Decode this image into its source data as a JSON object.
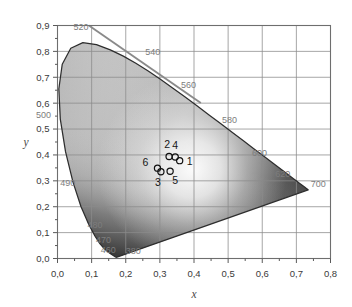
{
  "figure": {
    "kind": "cie-1931-chromaticity-diagram",
    "background_color": "#ffffff"
  },
  "axes": {
    "x_title": "x",
    "y_title": "y",
    "grid_color": "#8d8d8d",
    "frame_color": "#6e6e6e",
    "x_ticks": [
      "0,0",
      "0,1",
      "0,2",
      "0,3",
      "0,4",
      "0,5",
      "0,6",
      "0,7",
      "0,8"
    ],
    "y_ticks": [
      "0,0",
      "0,1",
      "0,2",
      "0,3",
      "0,4",
      "0,5",
      "0,6",
      "0,7",
      "0,8",
      "0,9"
    ]
  },
  "chart_data": {
    "type": "scatter",
    "title": "",
    "xlabel": "x",
    "ylabel": "y",
    "xlim": [
      0.0,
      0.8
    ],
    "ylim": [
      0.0,
      0.9
    ],
    "grid": true,
    "legend": "none",
    "xticks": [
      0.0,
      0.1,
      0.2,
      0.3,
      0.4,
      0.5,
      0.6,
      0.7,
      0.8
    ],
    "yticks": [
      0.0,
      0.1,
      0.2,
      0.3,
      0.4,
      0.5,
      0.6,
      0.7,
      0.8,
      0.9
    ],
    "points": [
      {
        "label": "1",
        "x": 0.358,
        "y": 0.378,
        "label_dx": 10,
        "label_dy": 4
      },
      {
        "label": "2",
        "x": 0.327,
        "y": 0.394,
        "label_dx": -2,
        "label_dy": -8
      },
      {
        "label": "3",
        "x": 0.303,
        "y": 0.335,
        "label_dx": -3,
        "label_dy": 14
      },
      {
        "label": "4",
        "x": 0.345,
        "y": 0.392,
        "label_dx": 0,
        "label_dy": -8
      },
      {
        "label": "5",
        "x": 0.33,
        "y": 0.337,
        "label_dx": 5,
        "label_dy": 13
      },
      {
        "label": "6",
        "x": 0.293,
        "y": 0.349,
        "label_dx": -12,
        "label_dy": -2
      }
    ],
    "marker": {
      "shape": "circle-open",
      "radius_px": 3.1,
      "edge_color": "#111111"
    },
    "spectral_locus": {
      "description": "CIE 1931 horseshoe outline, x/y pairs from 380nm to 700nm then closed by the line of purples",
      "outline": [
        [
          0.1741,
          0.005
        ],
        [
          0.174,
          0.005
        ],
        [
          0.1738,
          0.0049
        ],
        [
          0.1736,
          0.0049
        ],
        [
          0.1733,
          0.0048
        ],
        [
          0.173,
          0.0048
        ],
        [
          0.1726,
          0.0048
        ],
        [
          0.1721,
          0.0048
        ],
        [
          0.1714,
          0.0051
        ],
        [
          0.1703,
          0.0058
        ],
        [
          0.1689,
          0.0069
        ],
        [
          0.1669,
          0.0086
        ],
        [
          0.1644,
          0.0109
        ],
        [
          0.1611,
          0.0138
        ],
        [
          0.1566,
          0.0177
        ],
        [
          0.151,
          0.0227
        ],
        [
          0.144,
          0.0297
        ],
        [
          0.1355,
          0.0399
        ],
        [
          0.1241,
          0.0578
        ],
        [
          0.1096,
          0.0868
        ],
        [
          0.0913,
          0.1327
        ],
        [
          0.0687,
          0.2007
        ],
        [
          0.0454,
          0.295
        ],
        [
          0.0235,
          0.4127
        ],
        [
          0.0082,
          0.5384
        ],
        [
          0.0039,
          0.6548
        ],
        [
          0.0139,
          0.7502
        ],
        [
          0.0389,
          0.812
        ],
        [
          0.0743,
          0.8338
        ],
        [
          0.1142,
          0.8262
        ],
        [
          0.1547,
          0.8059
        ],
        [
          0.1929,
          0.7816
        ],
        [
          0.2296,
          0.7543
        ],
        [
          0.2658,
          0.7243
        ],
        [
          0.3016,
          0.6923
        ],
        [
          0.3373,
          0.6589
        ],
        [
          0.3731,
          0.6245
        ],
        [
          0.4087,
          0.5896
        ],
        [
          0.4441,
          0.5547
        ],
        [
          0.4788,
          0.5202
        ],
        [
          0.5125,
          0.4866
        ],
        [
          0.5448,
          0.4544
        ],
        [
          0.5752,
          0.4242
        ],
        [
          0.6029,
          0.3965
        ],
        [
          0.627,
          0.3725
        ],
        [
          0.6482,
          0.3514
        ],
        [
          0.6658,
          0.334
        ],
        [
          0.6801,
          0.3197
        ],
        [
          0.6915,
          0.3083
        ],
        [
          0.7006,
          0.2993
        ],
        [
          0.7079,
          0.292
        ],
        [
          0.714,
          0.2859
        ],
        [
          0.719,
          0.2809
        ],
        [
          0.723,
          0.277
        ],
        [
          0.726,
          0.274
        ],
        [
          0.7283,
          0.2717
        ],
        [
          0.73,
          0.27
        ],
        [
          0.7311,
          0.2689
        ],
        [
          0.732,
          0.268
        ],
        [
          0.7327,
          0.2673
        ],
        [
          0.7334,
          0.2666
        ],
        [
          0.734,
          0.266
        ],
        [
          0.7344,
          0.2656
        ],
        [
          0.7346,
          0.2654
        ]
      ]
    },
    "wavelength_labels": [
      {
        "text": "380",
        "x": 0.2,
        "y": 0.018
      },
      {
        "text": "460",
        "x": 0.127,
        "y": 0.02
      },
      {
        "text": "470",
        "x": 0.113,
        "y": 0.06
      },
      {
        "text": "480",
        "x": 0.088,
        "y": 0.117
      },
      {
        "text": "490",
        "x": 0.008,
        "y": 0.281
      },
      {
        "text": "500",
        "x": -0.063,
        "y": 0.543
      },
      {
        "text": "520",
        "x": 0.047,
        "y": 0.883
      },
      {
        "text": "540",
        "x": 0.257,
        "y": 0.787
      },
      {
        "text": "560",
        "x": 0.362,
        "y": 0.66
      },
      {
        "text": "580",
        "x": 0.482,
        "y": 0.525
      },
      {
        "text": "600",
        "x": 0.57,
        "y": 0.396
      },
      {
        "text": "620",
        "x": 0.638,
        "y": 0.315
      },
      {
        "text": "700",
        "x": 0.742,
        "y": 0.277
      }
    ],
    "tangent_line": {
      "description": "straight grey diagonal across the upper-left of the plot",
      "from": [
        0.092,
        0.9
      ],
      "to": [
        0.42,
        0.601
      ]
    }
  }
}
